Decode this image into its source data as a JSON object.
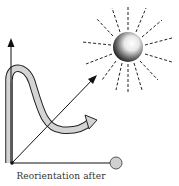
{
  "figure": {
    "caption": "Reorientation after",
    "colors": {
      "line": "#111111",
      "path_fill": "#d4d4d4",
      "target_fill": "#d0d0d0",
      "sun_dark": "#1a1a1a",
      "sun_light": "#f4f4f4"
    },
    "elements": [
      "vertical-axis-arrow",
      "horizontal-axis-with-target-circle",
      "diagonal-arrow-toward-sun",
      "sun-with-dashed-rays",
      "curved-reorientation-path-arrow"
    ]
  }
}
